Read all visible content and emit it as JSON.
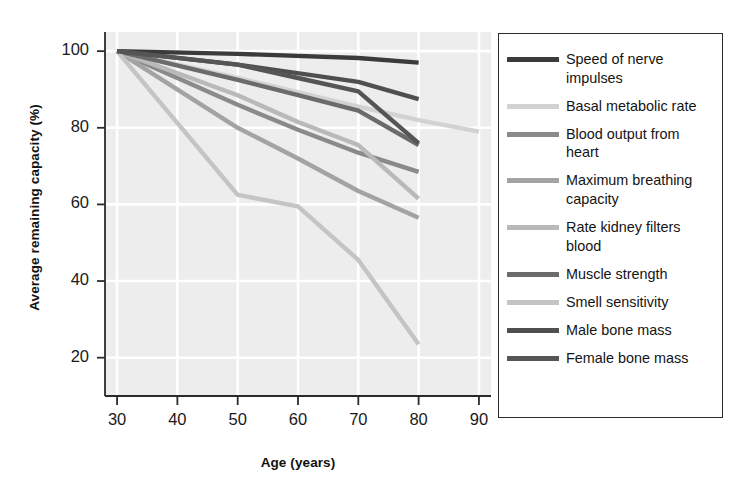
{
  "chart_data": {
    "type": "line",
    "title": "",
    "xlabel": "Age (years)",
    "ylabel": "Average remaining capacity (%)",
    "xlim": [
      28,
      92
    ],
    "ylim": [
      10,
      105
    ],
    "xticks": [
      30,
      40,
      50,
      60,
      70,
      80,
      90
    ],
    "yticks": [
      20,
      40,
      60,
      80,
      100
    ],
    "grid": true,
    "legend_position": "right",
    "plot_background": "#ededed",
    "grid_color": "#ffffff",
    "series": [
      {
        "name": "Speed of nerve impulses",
        "color": "#3b3b3b",
        "x": [
          30,
          50,
          70,
          80
        ],
        "y": [
          100,
          99.3,
          98.2,
          97.0
        ]
      },
      {
        "name": "Basal metabolic rate",
        "color": "#d2d2d2",
        "x": [
          30,
          50,
          70,
          80,
          90
        ],
        "y": [
          100,
          93.0,
          85.5,
          82.0,
          79.0
        ]
      },
      {
        "name": "Blood output from heart",
        "color": "#8a8a8a",
        "x": [
          30,
          50,
          60,
          70,
          80
        ],
        "y": [
          100,
          86.0,
          79.5,
          73.5,
          68.5
        ]
      },
      {
        "name": "Maximum breathing capacity",
        "color": "#a3a3a3",
        "x": [
          30,
          50,
          60,
          70,
          80
        ],
        "y": [
          100,
          80.0,
          72.0,
          63.5,
          56.5
        ]
      },
      {
        "name": "Rate kidney filters blood",
        "color": "#b9b9b9",
        "x": [
          30,
          50,
          60,
          70,
          80
        ],
        "y": [
          100,
          88.5,
          81.5,
          75.5,
          61.5
        ]
      },
      {
        "name": "Muscle strength",
        "color": "#6b6b6b",
        "x": [
          30,
          50,
          60,
          70,
          80
        ],
        "y": [
          100,
          92.5,
          88.5,
          84.5,
          75.5
        ]
      },
      {
        "name": "Smell sensitivity",
        "color": "#c4c4c4",
        "x": [
          30,
          50,
          60,
          70,
          80
        ],
        "y": [
          100,
          62.5,
          59.5,
          45.5,
          23.5
        ]
      },
      {
        "name": "Male bone mass",
        "color": "#4f4f4f",
        "x": [
          30,
          50,
          70,
          80
        ],
        "y": [
          100,
          96.5,
          92.0,
          87.5
        ]
      },
      {
        "name": "Female bone mass",
        "color": "#555555",
        "x": [
          30,
          50,
          60,
          70,
          80
        ],
        "y": [
          100,
          96.5,
          93.0,
          89.5,
          76.0
        ]
      }
    ]
  },
  "axes": {
    "x_title": "Age (years)",
    "y_title": "Average remaining capacity (%)",
    "x_tick_labels": [
      "30",
      "40",
      "50",
      "60",
      "70",
      "80",
      "90"
    ],
    "y_tick_labels": [
      "20",
      "40",
      "60",
      "80",
      "100"
    ]
  },
  "legend": {
    "items": [
      {
        "label": "Speed of nerve impulses",
        "color": "#3b3b3b"
      },
      {
        "label": "Basal metabolic rate",
        "color": "#d2d2d2"
      },
      {
        "label": "Blood output from heart",
        "color": "#8a8a8a"
      },
      {
        "label": "Maximum breathing capacity",
        "color": "#a3a3a3"
      },
      {
        "label": "Rate kidney filters blood",
        "color": "#b9b9b9"
      },
      {
        "label": "Muscle strength",
        "color": "#6b6b6b"
      },
      {
        "label": "Smell sensitivity",
        "color": "#c4c4c4"
      },
      {
        "label": "Male bone mass",
        "color": "#4f4f4f"
      },
      {
        "label": "Female bone mass",
        "color": "#555555"
      }
    ]
  }
}
